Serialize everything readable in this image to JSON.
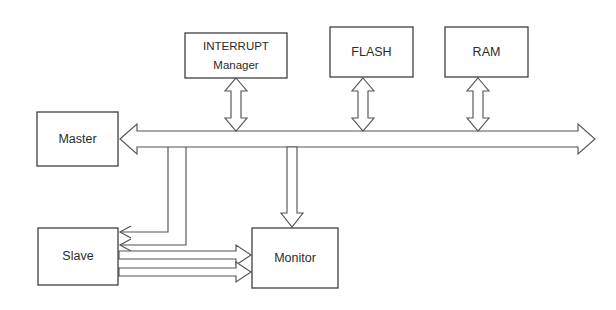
{
  "diagram": {
    "background_color": "#ffffff",
    "line_color": "#555555",
    "box_stroke_color": "#3f3f3f",
    "text_color": "#2b2b2b",
    "blocks": [
      {
        "id": "interrupt-manager",
        "label_line1": "INTERRUPT",
        "label_line2": "Manager",
        "x": 185,
        "y": 33,
        "width": 102,
        "height": 45
      },
      {
        "id": "flash",
        "label_line1": "FLASH",
        "label_line2": "",
        "x": 330,
        "y": 27,
        "width": 83,
        "height": 50
      },
      {
        "id": "ram",
        "label_line1": "RAM",
        "label_line2": "",
        "x": 445,
        "y": 27,
        "width": 83,
        "height": 50
      },
      {
        "id": "master",
        "label_line1": "Master",
        "label_line2": "",
        "x": 37,
        "y": 112,
        "width": 81,
        "height": 54
      },
      {
        "id": "slave",
        "label_line1": "Slave",
        "label_line2": "",
        "x": 38,
        "y": 228,
        "width": 80,
        "height": 57
      },
      {
        "id": "monitor",
        "label_line1": "Monitor",
        "label_line2": "",
        "x": 252,
        "y": 228,
        "width": 86,
        "height": 60
      }
    ],
    "connections": [
      {
        "id": "system-bus",
        "from": "master",
        "to": "bus-right-end",
        "style": "double-headed-block-arrow",
        "orientation": "horizontal",
        "x_start": 120,
        "x_end": 595,
        "y_center": 139,
        "shaft_half_width": 8,
        "head_length": 17,
        "head_half_width": 15
      },
      {
        "id": "bus-to-interrupt-manager",
        "from": "system-bus",
        "to": "interrupt-manager",
        "style": "double-headed-block-arrow",
        "orientation": "vertical",
        "x_center": 236,
        "y_start": 131,
        "y_end": 78,
        "shaft_half_width": 5,
        "head_length": 13,
        "head_half_width": 11
      },
      {
        "id": "bus-to-flash",
        "from": "system-bus",
        "to": "flash",
        "style": "double-headed-block-arrow",
        "orientation": "vertical",
        "x_center": 363,
        "y_start": 131,
        "y_end": 78,
        "shaft_half_width": 5,
        "head_length": 13,
        "head_half_width": 11
      },
      {
        "id": "bus-to-ram",
        "from": "system-bus",
        "to": "ram",
        "style": "double-headed-block-arrow",
        "orientation": "vertical",
        "x_center": 478,
        "y_start": 131,
        "y_end": 78,
        "shaft_half_width": 5,
        "head_length": 13,
        "head_half_width": 11
      },
      {
        "id": "bus-to-monitor",
        "from": "system-bus",
        "to": "monitor",
        "style": "single-headed-block-arrow",
        "orientation": "vertical-down",
        "x_center": 292,
        "y_start": 147,
        "y_end": 227,
        "shaft_half_width": 5,
        "head_length": 14,
        "head_half_width": 11
      },
      {
        "id": "bus-to-slave-upper",
        "from": "system-bus",
        "to": "slave",
        "style": "thin-routed-arrow",
        "orientation": "down-then-left",
        "x_drop": 168,
        "y_start": 147,
        "y_corner": 232,
        "x_end": 120
      },
      {
        "id": "bus-to-slave-lower",
        "from": "system-bus",
        "to": "slave",
        "style": "thin-routed-arrow",
        "orientation": "down-then-left",
        "x_drop": 186,
        "y_start": 147,
        "y_corner": 245,
        "x_end": 120
      },
      {
        "id": "slave-to-monitor-upper",
        "from": "slave",
        "to": "monitor",
        "style": "single-headed-block-arrow",
        "orientation": "horizontal-right",
        "y_center": 255,
        "x_start": 119,
        "x_end": 251,
        "shaft_half_width": 4,
        "head_length": 15,
        "head_half_width": 10
      },
      {
        "id": "slave-to-monitor-lower",
        "from": "slave",
        "to": "monitor",
        "style": "single-headed-block-arrow",
        "orientation": "horizontal-right",
        "y_center": 272,
        "x_start": 119,
        "x_end": 251,
        "shaft_half_width": 4,
        "head_length": 15,
        "head_half_width": 10
      }
    ]
  }
}
